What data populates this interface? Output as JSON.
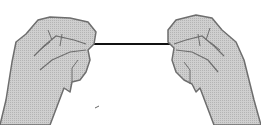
{
  "illustration": {
    "subject": "two-hands-holding-stretched-floss",
    "colors": {
      "background": "#ffffff",
      "skin_fill": "#c8c8c8",
      "outline": "#6e6e6e",
      "thread": "#111111"
    }
  }
}
